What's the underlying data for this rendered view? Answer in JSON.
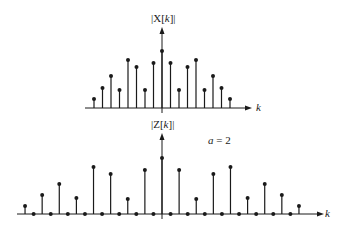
{
  "diagram": {
    "type": "stem-plots",
    "plots": [
      {
        "id": "top",
        "ylabel": "|X[k]|",
        "ylabel_parts": [
          "|X[",
          "k",
          "]|"
        ],
        "xlabel": "k",
        "axis_y": 108,
        "center_x": 162,
        "spacing": 8.5,
        "k_range": [
          -8,
          8
        ],
        "tops": [
          99,
          88,
          76,
          90,
          60,
          67,
          90,
          63,
          51,
          63,
          90,
          67,
          60,
          90,
          76,
          88,
          99
        ],
        "axis_x_start": 85,
        "axis_x_end": 246,
        "vaxis_top": 33,
        "vaxis_bottom": 113
      },
      {
        "id": "bottom",
        "ylabel": "|Z[k]|",
        "ylabel_parts": [
          "|Z[",
          "k",
          "]|"
        ],
        "xlabel": "k",
        "annotation": "a = 2",
        "annotation_parts": [
          "a",
          " = 2"
        ],
        "axis_y": 214,
        "center_x": 162,
        "spacing": 8.56,
        "k_range": [
          -16,
          16
        ],
        "tops": [
          206,
          214,
          195,
          214,
          184,
          214,
          198,
          214,
          167,
          214,
          174,
          214,
          199,
          214,
          170,
          214,
          158,
          214,
          170,
          214,
          199,
          214,
          174,
          214,
          167,
          214,
          198,
          214,
          184,
          214,
          195,
          214,
          206
        ],
        "axis_x_start": 17,
        "axis_x_end": 318,
        "vaxis_top": 139,
        "vaxis_bottom": 219
      }
    ]
  },
  "chart_data": [
    {
      "type": "stem",
      "title": "|X[k]|",
      "xlabel": "k",
      "ylabel": "|X[k]|",
      "x": [
        -8,
        -7,
        -6,
        -5,
        -4,
        -3,
        -2,
        -1,
        0,
        1,
        2,
        3,
        4,
        5,
        6,
        7,
        8
      ],
      "values": [
        0.16,
        0.35,
        0.56,
        0.32,
        0.84,
        0.72,
        0.32,
        0.79,
        1.0,
        0.79,
        0.32,
        0.72,
        0.84,
        0.32,
        0.56,
        0.35,
        0.16
      ]
    },
    {
      "type": "stem",
      "title": "|Z[k]|",
      "xlabel": "k",
      "ylabel": "|Z[k]|",
      "annotation": "a = 2",
      "x": [
        -16,
        -15,
        -14,
        -13,
        -12,
        -11,
        -10,
        -9,
        -8,
        -7,
        -6,
        -5,
        -4,
        -3,
        -2,
        -1,
        0,
        1,
        2,
        3,
        4,
        5,
        6,
        7,
        8,
        9,
        10,
        11,
        12,
        13,
        14,
        15,
        16
      ],
      "values": [
        0.14,
        0,
        0.34,
        0,
        0.54,
        0,
        0.29,
        0,
        0.84,
        0,
        0.71,
        0,
        0.27,
        0,
        0.79,
        0,
        1.0,
        0,
        0.79,
        0,
        0.27,
        0,
        0.71,
        0,
        0.84,
        0,
        0.29,
        0,
        0.54,
        0,
        0.34,
        0,
        0.14
      ]
    }
  ]
}
